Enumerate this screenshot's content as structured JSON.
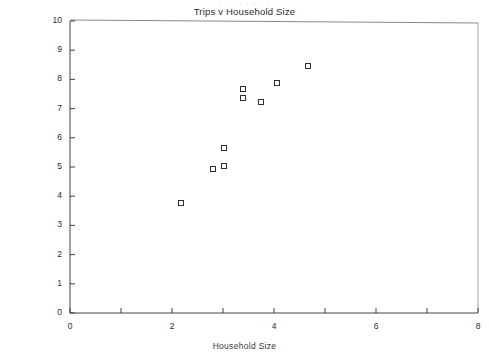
{
  "figure": {
    "clipped_header_text": "· · ·   · · ·   ·  ·",
    "width_px": 489,
    "height_px": 358,
    "background": "#ffffff",
    "ink_color": "#2e2e2e"
  },
  "chart_data": {
    "type": "scatter",
    "title": "Trips v Household Size",
    "xlabel": "Household Size",
    "ylabel": "Trips",
    "xlim": [
      0,
      8
    ],
    "ylim": [
      0,
      10
    ],
    "grid": false,
    "legend": null,
    "x_ticks": [
      0,
      1,
      2,
      3,
      4,
      5,
      6,
      7,
      8
    ],
    "x_tick_labels": [
      "0",
      "",
      "2",
      "",
      "4",
      "",
      "6",
      "",
      "8"
    ],
    "y_ticks": [
      0,
      1,
      2,
      3,
      4,
      5,
      6,
      7,
      8,
      9,
      10
    ],
    "y_tick_labels": [
      "0",
      "1",
      "2",
      "3",
      "4",
      "5",
      "6",
      "7",
      "8",
      "9",
      "10"
    ],
    "marker": "open-square",
    "series": [
      {
        "name": "Trips v Household Size",
        "points": [
          {
            "x": 2.18,
            "y": 3.77
          },
          {
            "x": 2.8,
            "y": 4.93
          },
          {
            "x": 3.02,
            "y": 5.03
          },
          {
            "x": 3.02,
            "y": 5.65
          },
          {
            "x": 3.39,
            "y": 7.36
          },
          {
            "x": 3.39,
            "y": 7.67
          },
          {
            "x": 3.75,
            "y": 7.23
          },
          {
            "x": 4.06,
            "y": 7.88
          },
          {
            "x": 4.67,
            "y": 8.46
          }
        ]
      }
    ]
  }
}
